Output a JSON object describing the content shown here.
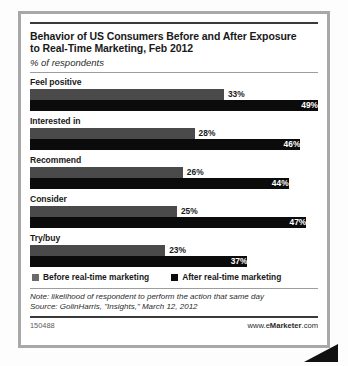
{
  "chart_data": {
    "type": "bar",
    "orientation": "horizontal",
    "title": "Behavior of US Consumers Before and After Exposure to Real-Time Marketing, Feb 2012",
    "subtitle": "% of respondents",
    "xlabel": "",
    "ylabel": "",
    "xlim": [
      0,
      49
    ],
    "grid": false,
    "legend_position": "bottom-left",
    "categories": [
      "Feel positive",
      "Interested in",
      "Recommend",
      "Consider",
      "Try/buy"
    ],
    "series": [
      {
        "name": "Before real-time marketing",
        "color": "#4a4a4a",
        "values": [
          33,
          28,
          26,
          25,
          23
        ],
        "labels": [
          "33%",
          "28%",
          "26%",
          "25%",
          "23%"
        ]
      },
      {
        "name": "After real-time marketing",
        "color": "#0b0b0b",
        "values": [
          49,
          46,
          44,
          47,
          37
        ],
        "labels": [
          "49%",
          "46%",
          "44%",
          "47%",
          "37%"
        ]
      }
    ],
    "note": "Note: likelihood of respondent to perform the action that same day",
    "source": "Source: GolinHarris, \"Insights,\" March 12, 2012"
  },
  "title": {
    "line1": "Behavior of US Consumers Before and After Exposure",
    "line2": "to Real-Time Marketing, Feb 2012",
    "subtitle": "% of respondents"
  },
  "legend": {
    "before_label": "Before real-time marketing",
    "after_label": "After real-time marketing"
  },
  "footer": {
    "note": "Note: likelihood of respondent to perform the action that same day",
    "source": "Source: GolinHarris, \"Insights,\" March 12, 2012",
    "id": "150488",
    "url_prefix": "www.e",
    "url_brand": "Marketer",
    "url_suffix": ".com"
  }
}
